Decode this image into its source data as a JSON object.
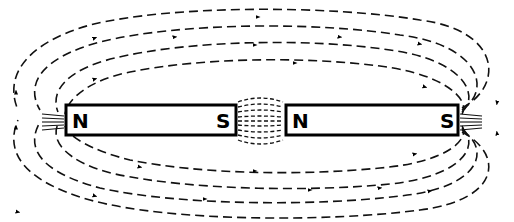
{
  "diagram": {
    "type": "magnetic-field-lines",
    "magnets": [
      {
        "id": "magnet-left",
        "left_pole": "N",
        "right_pole": "S"
      },
      {
        "id": "magnet-right",
        "left_pole": "N",
        "right_pole": "S"
      }
    ],
    "colors": {
      "line": "#111111",
      "background": "#ffffff"
    }
  }
}
